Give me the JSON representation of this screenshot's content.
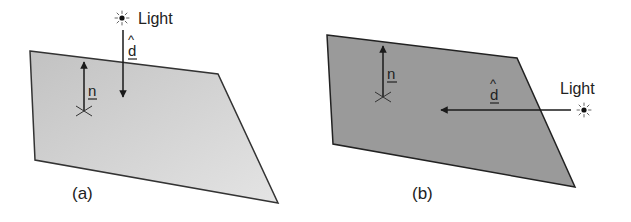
{
  "figure": {
    "panels": [
      {
        "id": "a",
        "caption": "(a)",
        "light_label": "Light",
        "normal_label": "n",
        "direction_label": "d",
        "direction_hat": "^",
        "surface_fill_start": "#c2c2c2",
        "surface_fill_end": "#e4e4e4",
        "light_position": "above surface, direction vector pointing straight down toward surface"
      },
      {
        "id": "b",
        "caption": "(b)",
        "light_label": "Light",
        "normal_label": "n",
        "direction_label": "d",
        "direction_hat": "^",
        "surface_fill_start": "#9a9a9a",
        "surface_fill_end": "#9a9a9a",
        "light_position": "beside surface, direction vector pointing horizontally parallel to surface"
      }
    ],
    "colors": {
      "outline": "#333333",
      "arrow": "#1a1a1a",
      "text": "#222222",
      "background": "#ffffff"
    },
    "icons": {
      "light": "sun-light-source-icon",
      "surface_point": "cross-point-icon"
    }
  }
}
